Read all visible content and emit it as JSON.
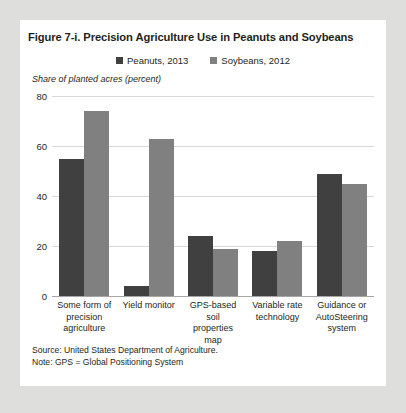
{
  "figure": {
    "title": "Figure 7-i. Precision Agriculture Use in Peanuts and Soybeans",
    "y_axis_title": "Share of planted acres (percent)",
    "source": "Source: United States Department of Agriculture.",
    "note": "Note: GPS = Global Positioning System"
  },
  "colors": {
    "page_background": "#dededc",
    "card_background": "#ffffff",
    "series_1": "#404040",
    "series_2": "#808080",
    "gridline": "#d9d9d9",
    "axis": "#a6a6a6",
    "text": "#231f20"
  },
  "chart_data": {
    "type": "bar",
    "title": "Figure 7-i. Precision Agriculture Use in Peanuts and Soybeans",
    "xlabel": "",
    "ylabel": "Share of planted acres (percent)",
    "ylim": [
      0,
      80
    ],
    "yticks": [
      0,
      20,
      40,
      60,
      80
    ],
    "grid": true,
    "legend_position": "top-center",
    "categories": [
      "Some form of precision agriculture",
      "Yield monitor",
      "GPS-based soil properties map",
      "Variable rate technology",
      "Guidance or AutoSteering system"
    ],
    "category_lines": [
      [
        "Some form of",
        "precision",
        "agriculture"
      ],
      [
        "Yield monitor"
      ],
      [
        "GPS-based soil",
        "properties",
        "map"
      ],
      [
        "Variable rate",
        "technology"
      ],
      [
        "Guidance or",
        "AutoSteering",
        "system"
      ]
    ],
    "series": [
      {
        "name": "Peanuts, 2013",
        "color": "#404040",
        "values": [
          55,
          4,
          24,
          18,
          49
        ]
      },
      {
        "name": "Soybeans, 2012",
        "color": "#808080",
        "values": [
          74,
          63,
          19,
          22,
          45
        ]
      }
    ]
  }
}
